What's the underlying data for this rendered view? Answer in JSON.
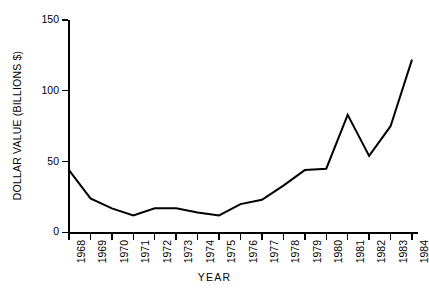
{
  "chart_data": {
    "type": "line",
    "title": "",
    "subtitle": "",
    "xlabel": "YEAR",
    "ylabel": "DOLLAR VALUE (BILLIONS $)",
    "categories": [
      "1968",
      "1969",
      "1970",
      "1971",
      "1972",
      "1973",
      "1974",
      "1975",
      "1976",
      "1977",
      "1978",
      "1979",
      "1980",
      "1981",
      "1982",
      "1983",
      "1984"
    ],
    "x": [
      1968,
      1969,
      1970,
      1971,
      1972,
      1973,
      1974,
      1975,
      1976,
      1977,
      1978,
      1979,
      1980,
      1981,
      1982,
      1983,
      1984
    ],
    "values": [
      44,
      24,
      17,
      12,
      17,
      17,
      14,
      12,
      20,
      23,
      33,
      44,
      45,
      83,
      54,
      75,
      122
    ],
    "series": [
      {
        "name": "Dollar value",
        "values": [
          44,
          24,
          17,
          12,
          17,
          17,
          14,
          12,
          20,
          23,
          33,
          44,
          45,
          83,
          54,
          75,
          122
        ],
        "color": "#000000"
      }
    ],
    "xlim": [
      1968,
      1984
    ],
    "ylim": [
      0,
      150
    ],
    "yticks": [
      0,
      50,
      100,
      150
    ],
    "ytick_labels": [
      "0",
      "50",
      "100",
      "150"
    ],
    "xticks": [
      1968,
      1969,
      1970,
      1971,
      1972,
      1973,
      1974,
      1975,
      1976,
      1977,
      1978,
      1979,
      1980,
      1981,
      1982,
      1983,
      1984
    ],
    "xtick_labels": [
      "1968",
      "1969",
      "1970",
      "1971",
      "1972",
      "1973",
      "1974",
      "1975",
      "1976",
      "1977",
      "1978",
      "1979",
      "1980",
      "1981",
      "1982",
      "1983",
      "1984"
    ],
    "xtick_rotation": 90,
    "grid": false,
    "legend": false,
    "legend_position": "none",
    "line_color": "#000000",
    "line_width": 2,
    "background_color": "#ffffff",
    "axis_color": "#000000",
    "spines": [
      "left",
      "bottom"
    ],
    "annotations": []
  }
}
